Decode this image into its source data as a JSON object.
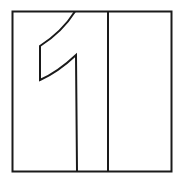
{
  "figure": {
    "numeral": "1",
    "stroke_color": "#1a1a1a",
    "background_color": "#ffffff"
  }
}
